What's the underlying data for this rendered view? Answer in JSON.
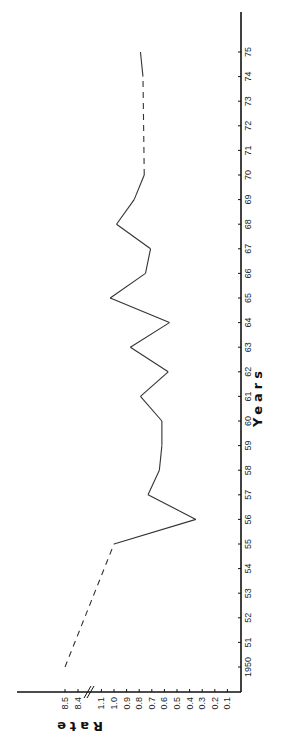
{
  "chart_data": {
    "type": "line",
    "orientation": "rotated-90-ccw",
    "title": "",
    "xlabel": "Years",
    "ylabel": "Rate",
    "x_tick_labels": [
      "1950",
      "51",
      "52",
      "53",
      "54",
      "55",
      "56",
      "57",
      "58",
      "59",
      "60",
      "61",
      "62",
      "63",
      "64",
      "65",
      "66",
      "67",
      "68",
      "69",
      "70",
      "71",
      "72",
      "73",
      "74",
      "75"
    ],
    "y_tick_labels": [
      "0.1",
      "0.2",
      "0.3",
      "0.4",
      "0.5",
      "0.6",
      "0.7",
      "0.8",
      "0.9",
      "1.0",
      "1.1",
      "8.4",
      "8.5"
    ],
    "y_axis_break": "between 1.1 and 8.4",
    "grid": false,
    "legend": null,
    "series": [
      {
        "name": "Rate",
        "points": [
          {
            "x": 1950,
            "y": 8.5,
            "style": "dashed"
          },
          {
            "x": 1955,
            "y": 1.0,
            "style": "solid"
          },
          {
            "x": 1956,
            "y": 0.35,
            "style": "solid"
          },
          {
            "x": 1957,
            "y": 0.73,
            "style": "solid"
          },
          {
            "x": 1958,
            "y": 0.64,
            "style": "solid"
          },
          {
            "x": 1959,
            "y": 0.62,
            "style": "solid"
          },
          {
            "x": 1960,
            "y": 0.62,
            "style": "solid"
          },
          {
            "x": 1961,
            "y": 0.79,
            "style": "solid"
          },
          {
            "x": 1962,
            "y": 0.57,
            "style": "solid"
          },
          {
            "x": 1963,
            "y": 0.87,
            "style": "solid"
          },
          {
            "x": 1964,
            "y": 0.56,
            "style": "solid"
          },
          {
            "x": 1965,
            "y": 1.03,
            "style": "solid"
          },
          {
            "x": 1966,
            "y": 0.75,
            "style": "solid"
          },
          {
            "x": 1967,
            "y": 0.71,
            "style": "solid"
          },
          {
            "x": 1968,
            "y": 0.98,
            "style": "solid"
          },
          {
            "x": 1969,
            "y": 0.84,
            "style": "solid"
          },
          {
            "x": 1970,
            "y": 0.76,
            "style": "dashed"
          },
          {
            "x": 1974,
            "y": 0.77,
            "style": "solid"
          },
          {
            "x": 1975,
            "y": 0.79,
            "style": "solid"
          }
        ],
        "dashed_segments": [
          "1950-1955",
          "1970-1974"
        ]
      }
    ]
  },
  "labels": {
    "x_axis_title": "Years",
    "y_axis_title": "Rate"
  },
  "colors": {
    "line": "#333333",
    "axis": "#111111",
    "background": "#ffffff"
  }
}
